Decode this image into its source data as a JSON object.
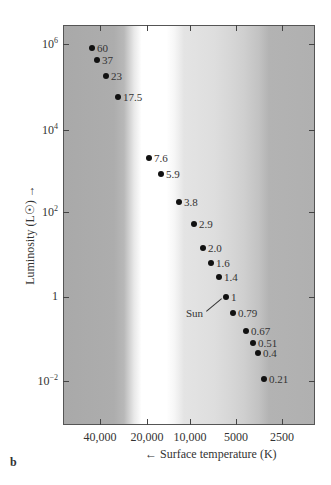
{
  "panel_label": "b",
  "axes": {
    "x_title": "Surface temperature (K)",
    "x_arrow": "←",
    "y_title": "Luminosity (L☉)",
    "y_arrow": "→",
    "x_ticks": [
      {
        "label": "40,000",
        "x": 100
      },
      {
        "label": "20,000",
        "x": 147
      },
      {
        "label": "10,000",
        "x": 190
      },
      {
        "label": "5000",
        "x": 236
      },
      {
        "label": "2500",
        "x": 282
      }
    ],
    "y_ticks": [
      {
        "base": "10",
        "exp": "6",
        "y": 44
      },
      {
        "base": "10",
        "exp": "4",
        "y": 130
      },
      {
        "base": "10",
        "exp": "2",
        "y": 212
      },
      {
        "base": "1",
        "exp": "",
        "y": 297
      },
      {
        "base": "10",
        "exp": "−2",
        "y": 381
      }
    ]
  },
  "sun_label": "Sun",
  "chart_data": {
    "type": "scatter",
    "title": "",
    "xlabel": "Surface temperature (K)",
    "ylabel": "Luminosity (L☉)",
    "x_scale": "log (reversed)",
    "y_scale": "log",
    "x_ticks": [
      "40,000",
      "20,000",
      "10,000",
      "5000",
      "2500"
    ],
    "y_ticks": [
      "10^6",
      "10^4",
      "10^2",
      "1",
      "10^-2"
    ],
    "xlim": [
      80000,
      1800
    ],
    "ylim": [
      0.001,
      2000000
    ],
    "grid": false,
    "legend": null,
    "annotations": [
      "Sun (mass 1)",
      "point labels are stellar masses in solar masses"
    ],
    "points": [
      {
        "mass": "60",
        "px": 92,
        "py": 48
      },
      {
        "mass": "37",
        "px": 97,
        "py": 60
      },
      {
        "mass": "23",
        "px": 106,
        "py": 76
      },
      {
        "mass": "17.5",
        "px": 118,
        "py": 97
      },
      {
        "mass": "7.6",
        "px": 149,
        "py": 158
      },
      {
        "mass": "5.9",
        "px": 161,
        "py": 174
      },
      {
        "mass": "3.8",
        "px": 179,
        "py": 202
      },
      {
        "mass": "2.9",
        "px": 194,
        "py": 224
      },
      {
        "mass": "2.0",
        "px": 203,
        "py": 248
      },
      {
        "mass": "1.6",
        "px": 211,
        "py": 263
      },
      {
        "mass": "1.4",
        "px": 219,
        "py": 277
      },
      {
        "mass": "1",
        "px": 226,
        "py": 297
      },
      {
        "mass": "0.79",
        "px": 233,
        "py": 313
      },
      {
        "mass": "0.67",
        "px": 246,
        "py": 331
      },
      {
        "mass": "0.51",
        "px": 253,
        "py": 343
      },
      {
        "mass": "0.4",
        "px": 258,
        "py": 353
      },
      {
        "mass": "0.21",
        "px": 264,
        "py": 379
      }
    ]
  }
}
